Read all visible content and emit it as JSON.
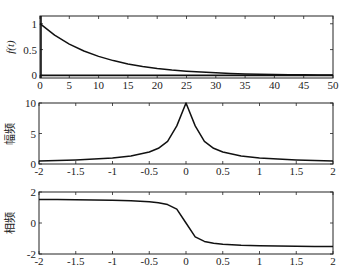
{
  "chart_data": [
    {
      "type": "line",
      "title": "",
      "xlabel": "",
      "ylabel": "f(t)",
      "xlim": [
        0,
        50
      ],
      "ylim": [
        -0.05,
        1.15
      ],
      "xticks": [
        0,
        5,
        10,
        15,
        20,
        25,
        30,
        35,
        40,
        45,
        50
      ],
      "yticks": [
        0,
        0.5,
        1
      ],
      "ytick_labels": [
        "0",
        "0.5",
        "1"
      ],
      "function": "exp(-t/10)",
      "x": [
        0,
        2.5,
        5,
        7.5,
        10,
        12.5,
        15,
        17.5,
        20,
        22.5,
        25,
        27.5,
        30,
        32.5,
        35,
        37.5,
        40,
        42.5,
        45,
        47.5,
        50
      ],
      "values": [
        1.0,
        0.779,
        0.607,
        0.472,
        0.368,
        0.287,
        0.223,
        0.174,
        0.135,
        0.105,
        0.082,
        0.064,
        0.05,
        0.039,
        0.03,
        0.024,
        0.018,
        0.014,
        0.011,
        0.009,
        0.007
      ],
      "annotations": [
        "vertical line at t=0",
        "horizontal line at f=0"
      ],
      "grid": false
    },
    {
      "type": "line",
      "title": "",
      "xlabel": "",
      "ylabel": "幅频",
      "xlim": [
        -2,
        2
      ],
      "ylim": [
        0,
        10
      ],
      "xticks": [
        -2,
        -1.5,
        -1,
        -0.5,
        0,
        0.5,
        1,
        1.5,
        2
      ],
      "yticks": [
        0,
        5,
        10
      ],
      "x": [
        -2,
        -1.75,
        -1.5,
        -1.25,
        -1,
        -0.75,
        -0.5,
        -0.375,
        -0.25,
        -0.125,
        0,
        0.125,
        0.25,
        0.375,
        0.5,
        0.75,
        1,
        1.25,
        1.5,
        1.75,
        2
      ],
      "values": [
        0.5,
        0.57,
        0.67,
        0.8,
        1.0,
        1.32,
        1.96,
        2.58,
        3.71,
        6.25,
        10.0,
        6.25,
        3.71,
        2.58,
        1.96,
        1.32,
        1.0,
        0.8,
        0.67,
        0.57,
        0.5
      ],
      "grid": false
    },
    {
      "type": "line",
      "title": "",
      "xlabel": "",
      "ylabel": "相频",
      "xlim": [
        -2,
        2
      ],
      "ylim": [
        -2,
        2
      ],
      "xticks": [
        -2,
        -1.5,
        -1,
        -0.5,
        0,
        0.5,
        1,
        1.5,
        2
      ],
      "yticks": [
        -2,
        0,
        2
      ],
      "x": [
        -2,
        -1.75,
        -1.5,
        -1.25,
        -1,
        -0.75,
        -0.5,
        -0.375,
        -0.25,
        -0.125,
        0,
        0.125,
        0.25,
        0.375,
        0.5,
        0.75,
        1,
        1.25,
        1.5,
        1.75,
        2
      ],
      "values": [
        1.52,
        1.514,
        1.504,
        1.491,
        1.471,
        1.438,
        1.373,
        1.31,
        1.19,
        0.896,
        0.0,
        -0.896,
        -1.19,
        -1.31,
        -1.373,
        -1.438,
        -1.471,
        -1.491,
        -1.504,
        -1.514,
        -1.52
      ],
      "grid": false
    }
  ],
  "labels": {
    "plot1_ylabel": "f(t)",
    "plot2_ylabel": "幅频",
    "plot3_ylabel": "相频"
  }
}
